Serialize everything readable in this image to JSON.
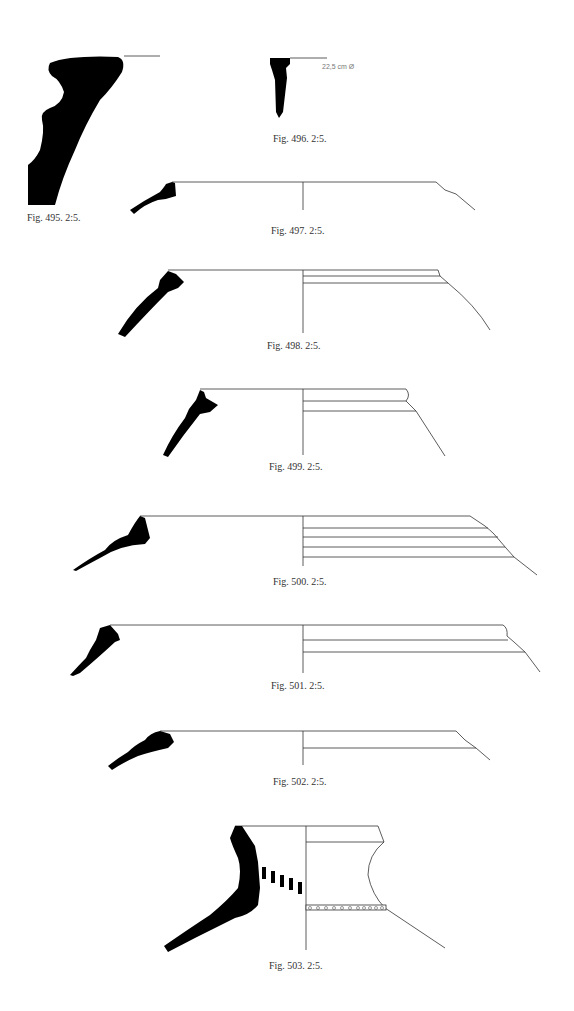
{
  "figures": [
    {
      "id": "495",
      "caption": "Fig. 495. 2:5."
    },
    {
      "id": "496",
      "caption": "Fig. 496. 2:5.",
      "diameter_label": "22,5 cm Ø"
    },
    {
      "id": "497",
      "caption": "Fig. 497. 2:5."
    },
    {
      "id": "498",
      "caption": "Fig. 498. 2:5."
    },
    {
      "id": "499",
      "caption": "Fig. 499. 2:5."
    },
    {
      "id": "500",
      "caption": "Fig. 500. 2:5."
    },
    {
      "id": "501",
      "caption": "Fig. 501. 2:5."
    },
    {
      "id": "502",
      "caption": "Fig. 502. 2:5."
    },
    {
      "id": "503",
      "caption": "Fig. 503. 2:5."
    }
  ],
  "colors": {
    "section_fill": "#000000",
    "line": "#333333",
    "background": "#ffffff"
  }
}
